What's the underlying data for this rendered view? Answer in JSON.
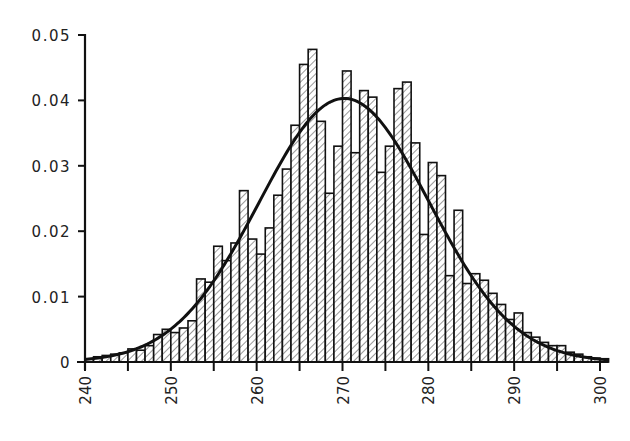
{
  "chart_data": {
    "type": "bar",
    "title": "",
    "xlabel": "",
    "ylabel": "",
    "xlim": [
      240,
      301
    ],
    "ylim": [
      0,
      0.05
    ],
    "grid": false,
    "legend": null,
    "bin_width": 1,
    "x_ticks": [
      "240",
      "250",
      "260",
      "270",
      "280",
      "290",
      "300"
    ],
    "x_tick_values": [
      240,
      250,
      260,
      270,
      280,
      290,
      300
    ],
    "x_minor_ticks": [
      245,
      255,
      265,
      275,
      285,
      295
    ],
    "y_ticks": [
      "0",
      "0.01",
      "0.02",
      "0.03",
      "0.04",
      "0.05"
    ],
    "y_tick_values": [
      0,
      0.01,
      0.02,
      0.03,
      0.04,
      0.05
    ],
    "bin_starts": [
      240,
      241,
      242,
      243,
      244,
      245,
      246,
      247,
      248,
      249,
      250,
      251,
      252,
      253,
      254,
      255,
      256,
      257,
      258,
      259,
      260,
      261,
      262,
      263,
      264,
      265,
      266,
      267,
      268,
      269,
      270,
      271,
      272,
      273,
      274,
      275,
      276,
      277,
      278,
      279,
      280,
      281,
      282,
      283,
      284,
      285,
      286,
      287,
      288,
      289,
      290,
      291,
      292,
      293,
      294,
      295,
      296,
      297,
      298,
      299,
      300
    ],
    "values": [
      0.0005,
      0.0008,
      0.001,
      0.0012,
      0.0014,
      0.002,
      0.0018,
      0.0025,
      0.0042,
      0.005,
      0.0045,
      0.0052,
      0.0063,
      0.0127,
      0.0122,
      0.0177,
      0.0155,
      0.0182,
      0.0262,
      0.0188,
      0.0165,
      0.0205,
      0.0255,
      0.0295,
      0.0362,
      0.0455,
      0.0478,
      0.0368,
      0.0258,
      0.033,
      0.0445,
      0.032,
      0.0415,
      0.0405,
      0.029,
      0.033,
      0.0418,
      0.0428,
      0.0335,
      0.0195,
      0.0305,
      0.0285,
      0.0132,
      0.0232,
      0.012,
      0.0135,
      0.0125,
      0.0105,
      0.0088,
      0.0065,
      0.0075,
      0.0045,
      0.0038,
      0.003,
      0.0025,
      0.0025,
      0.0015,
      0.0012,
      0.0008,
      0.0006,
      0.0005
    ],
    "bar_style": "hatched (diagonal lines), black outline",
    "overlay_curve": {
      "type": "normal_pdf",
      "mean": 270.2,
      "std": 9.9,
      "peak": 0.0403,
      "color": "#111111"
    }
  }
}
